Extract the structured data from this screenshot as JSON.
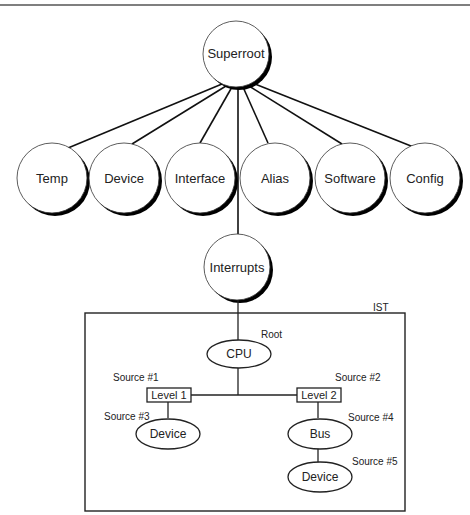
{
  "diagram": {
    "superroot": "Superroot",
    "children": [
      "Temp",
      "Device",
      "Interface",
      "Alias",
      "Software",
      "Config"
    ],
    "interrupts": "Interrupts",
    "ist": {
      "label": "IST",
      "root_label": "Root",
      "cpu": "CPU",
      "level1": "Level 1",
      "level2": "Level 2",
      "source1": "Source #1",
      "source2": "Source #2",
      "source3": "Source #3",
      "source4": "Source #4",
      "source5": "Source #5",
      "device_left": "Device",
      "bus": "Bus",
      "device_right": "Device"
    }
  }
}
